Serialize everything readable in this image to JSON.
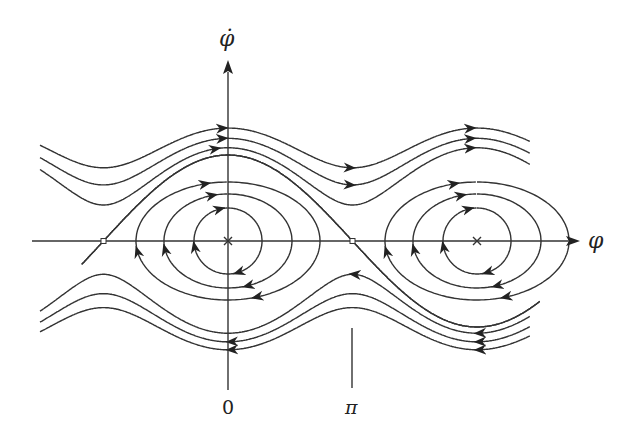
{
  "diagram": {
    "x_axis_label": "φ",
    "y_axis_label": "φ̇",
    "tick_labels": [
      "0",
      "π"
    ],
    "colors": {
      "stroke": "#333333",
      "background": "#ffffff"
    },
    "fixed_points": [
      {
        "type": "saddle",
        "phi": "-π"
      },
      {
        "type": "center",
        "phi": "0"
      },
      {
        "type": "saddle",
        "phi": "π"
      },
      {
        "type": "center",
        "phi": "2π"
      }
    ],
    "trajectories": {
      "rotations_above": {
        "count": 3,
        "direction": "right"
      },
      "rotations_below": {
        "count": 3,
        "direction": "left"
      },
      "closed_orbits_per_center": 3,
      "separatrices": "heteroclinic connections between saddles"
    }
  }
}
